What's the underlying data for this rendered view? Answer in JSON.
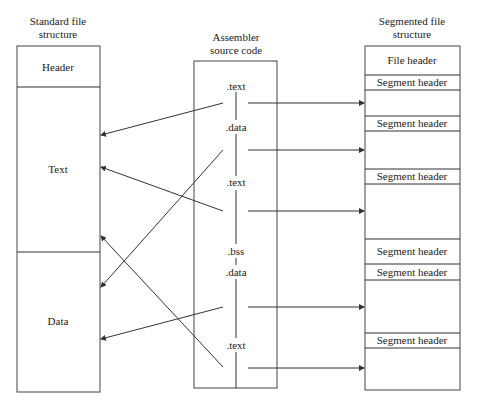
{
  "left": {
    "title_line1": "Standard file",
    "title_line2": "structure",
    "sections": [
      "Header",
      "Text",
      "Data"
    ]
  },
  "middle": {
    "title_line1": "Assembler",
    "title_line2": "source code",
    "directives": [
      ".text",
      ".data",
      ".text",
      ".bss",
      ".data",
      ".text"
    ]
  },
  "right": {
    "title_line1": "Segmented file",
    "title_line2": "structure",
    "file_header": "File header",
    "segment_headers": [
      "Segment header",
      "Segment header",
      "Segment header",
      "Segment header",
      "Segment header",
      "Segment header"
    ]
  },
  "colors": {
    "line": "#333333",
    "background": "#ffffff"
  }
}
